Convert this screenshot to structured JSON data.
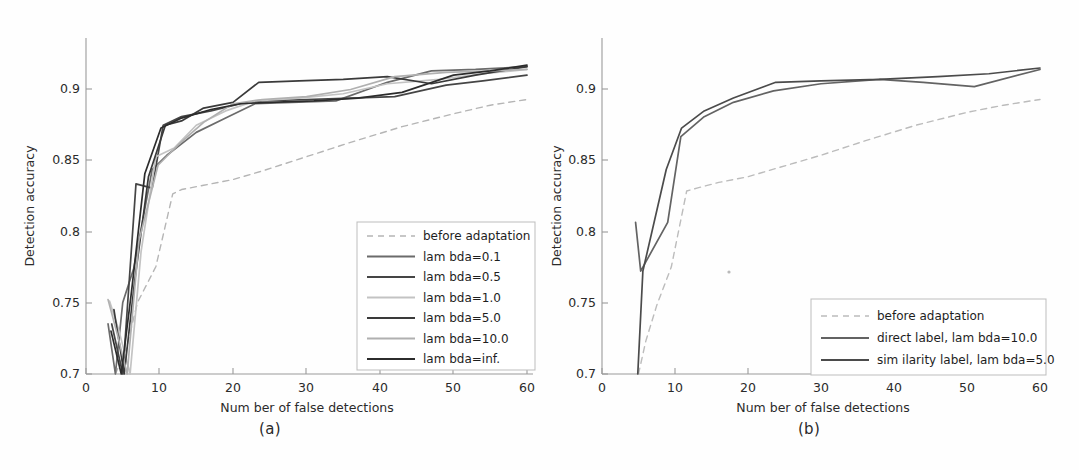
{
  "figure": {
    "background_color": "#fefefe",
    "panels": [
      {
        "id": "a",
        "caption": "(a)"
      },
      {
        "id": "b",
        "caption": "(b)"
      }
    ]
  },
  "chart_data": [
    {
      "type": "line",
      "panel": "a",
      "title": "",
      "xlabel": "Num ber of false detections",
      "ylabel": "Detection accuracy",
      "xlim": [
        0,
        60
      ],
      "ylim": [
        0.7,
        0.935
      ],
      "xticks": [
        0,
        10,
        20,
        30,
        40,
        50,
        60
      ],
      "yticks": [
        0.7,
        0.75,
        0.8,
        0.85,
        0.9
      ],
      "xtick_labels": [
        "0",
        "10",
        "20",
        "30",
        "40",
        "50",
        "60"
      ],
      "ytick_labels": [
        "0.7",
        "0.75",
        "0.8",
        "0.85",
        "0.9"
      ],
      "grid": false,
      "legend_position": "lower right",
      "series": [
        {
          "name": "before adaptation",
          "style": "dashed",
          "color": "#b5b5b5",
          "x": [
            4.0,
            5.5,
            7.0,
            9.5,
            11.8,
            13.0,
            16.0,
            20.0,
            24.0,
            30.0,
            36.0,
            43.0,
            50.0,
            55.0,
            60.0
          ],
          "y": [
            0.7,
            0.718,
            0.75,
            0.775,
            0.826,
            0.829,
            0.832,
            0.836,
            0.842,
            0.852,
            0.862,
            0.873,
            0.882,
            0.888,
            0.892
          ]
        },
        {
          "name": "lam bda=0.1",
          "style": "solid",
          "color": "#6b6b6b",
          "x": [
            3.0,
            4.0,
            5.0,
            6.5,
            9.0,
            11.0,
            15.0,
            19.0,
            23.0,
            28.0,
            34.0,
            41.0,
            47.0,
            53.0,
            60.0
          ],
          "y": [
            0.735,
            0.7,
            0.75,
            0.774,
            0.843,
            0.853,
            0.869,
            0.879,
            0.889,
            0.89,
            0.891,
            0.904,
            0.912,
            0.913,
            0.915
          ]
        },
        {
          "name": "lam bda=0.5",
          "style": "solid",
          "color": "#454545",
          "x": [
            3.5,
            5.0,
            6.8,
            9.0,
            10.5,
            13.0,
            17.0,
            21.0,
            24.0,
            30.0,
            36.0,
            42.0,
            49.0,
            54.0,
            60.0
          ],
          "y": [
            0.735,
            0.7,
            0.833,
            0.83,
            0.874,
            0.88,
            0.884,
            0.889,
            0.891,
            0.892,
            0.893,
            0.894,
            0.902,
            0.905,
            0.909
          ]
        },
        {
          "name": "lam bda=1.0",
          "style": "solid",
          "color": "#c3c3c3",
          "x": [
            3.2,
            4.5,
            6.0,
            7.5,
            9.5,
            12.0,
            15.0,
            19.0,
            23.0,
            29.0,
            35.0,
            41.0,
            48.0,
            54.0,
            60.0
          ],
          "y": [
            0.751,
            0.73,
            0.7,
            0.786,
            0.852,
            0.858,
            0.874,
            0.884,
            0.891,
            0.893,
            0.896,
            0.903,
            0.906,
            0.91,
            0.913
          ]
        },
        {
          "name": "lam bda=5.0",
          "style": "solid",
          "color": "#3a3a3a",
          "x": [
            3.8,
            5.2,
            6.6,
            8.5,
            10.8,
            13.0,
            16.0,
            20.0,
            23.5,
            29.0,
            35.0,
            41.0,
            47.0,
            53.0,
            60.0
          ],
          "y": [
            0.745,
            0.7,
            0.764,
            0.838,
            0.874,
            0.877,
            0.886,
            0.89,
            0.904,
            0.905,
            0.906,
            0.908,
            0.903,
            0.909,
            0.915
          ]
        },
        {
          "name": "lam bda=10.0",
          "style": "solid",
          "color": "#b0b0b0",
          "x": [
            3.0,
            4.3,
            5.6,
            7.2,
            9.8,
            12.5,
            16.0,
            20.0,
            24.0,
            30.0,
            36.0,
            42.0,
            49.0,
            55.0,
            60.0
          ],
          "y": [
            0.752,
            0.727,
            0.7,
            0.793,
            0.846,
            0.86,
            0.876,
            0.889,
            0.892,
            0.894,
            0.899,
            0.908,
            0.911,
            0.912,
            0.913
          ]
        },
        {
          "name": "lam bda=inf.",
          "style": "solid",
          "color": "#2c2c2c",
          "x": [
            3.4,
            4.8,
            6.2,
            8.0,
            10.2,
            13.0,
            17.0,
            21.0,
            25.0,
            31.0,
            37.0,
            43.0,
            50.0,
            55.0,
            60.0
          ],
          "y": [
            0.73,
            0.7,
            0.758,
            0.84,
            0.872,
            0.879,
            0.885,
            0.889,
            0.89,
            0.891,
            0.893,
            0.897,
            0.909,
            0.912,
            0.916
          ]
        }
      ]
    },
    {
      "type": "line",
      "panel": "b",
      "title": "",
      "xlabel": "Num ber of false detections",
      "ylabel": "Detection accuracy",
      "xlim": [
        0,
        60
      ],
      "ylim": [
        0.7,
        0.935
      ],
      "xticks": [
        0,
        10,
        20,
        30,
        40,
        50,
        60
      ],
      "yticks": [
        0.7,
        0.75,
        0.8,
        0.85,
        0.9
      ],
      "xtick_labels": [
        "0",
        "10",
        "20",
        "30",
        "40",
        "50",
        "60"
      ],
      "ytick_labels": [
        "0.7",
        "0.75",
        "0.8",
        "0.85",
        "0.9"
      ],
      "grid": false,
      "legend_position": "lower right",
      "series": [
        {
          "name": "before adaptation",
          "style": "dashed",
          "color": "#bcbcbc",
          "x": [
            5.0,
            6.0,
            7.5,
            9.5,
            11.6,
            13.0,
            16.0,
            20.0,
            24.0,
            30.0,
            36.0,
            43.0,
            50.0,
            55.0,
            60.0
          ],
          "y": [
            0.7,
            0.723,
            0.748,
            0.775,
            0.828,
            0.83,
            0.834,
            0.838,
            0.844,
            0.853,
            0.863,
            0.874,
            0.883,
            0.888,
            0.892
          ]
        },
        {
          "name": "direct label, lam bda=10.0",
          "style": "solid",
          "color": "#636363",
          "x": [
            4.6,
            5.3,
            9.0,
            10.8,
            14.0,
            18.0,
            23.5,
            30.0,
            38.0,
            44.0,
            51.0,
            60.0
          ],
          "y": [
            0.806,
            0.772,
            0.806,
            0.866,
            0.88,
            0.89,
            0.898,
            0.903,
            0.906,
            0.904,
            0.901,
            0.913
          ]
        },
        {
          "name": "sim ilarity label, lam bda=5.0",
          "style": "solid",
          "color": "#4b4b4b",
          "x": [
            4.9,
            5.6,
            8.8,
            10.9,
            14.0,
            18.0,
            23.8,
            30.0,
            38.0,
            46.0,
            53.0,
            60.0
          ],
          "y": [
            0.7,
            0.772,
            0.843,
            0.872,
            0.884,
            0.893,
            0.904,
            0.905,
            0.906,
            0.908,
            0.91,
            0.914
          ]
        }
      ]
    }
  ]
}
